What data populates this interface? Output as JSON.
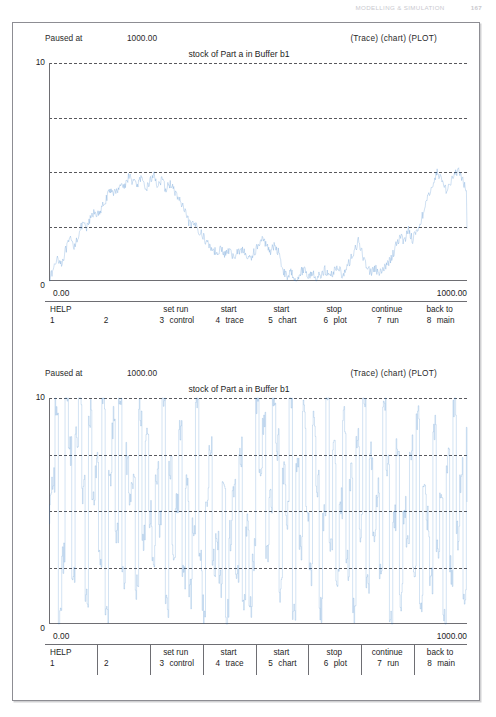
{
  "running_head": {
    "title": "MODELLING & SIMULATION",
    "page": "167"
  },
  "panels": [
    {
      "id": "chart-panel",
      "status_label": "Paused at",
      "status_value": "1000.00",
      "mode_tags": "(Trace) (chart) (PLOT)",
      "title": "stock of Part a in Buffer b1",
      "x_min_label": "0.00",
      "x_max_label": "1000.00",
      "y_max_label": "10",
      "y_min_label": "0",
      "fkeys": [
        {
          "num": "1",
          "top": "HELP",
          "bot": ""
        },
        {
          "num": "2",
          "top": "",
          "bot": ""
        },
        {
          "num": "3",
          "top": "set run",
          "bot": "control"
        },
        {
          "num": "4",
          "top": "start",
          "bot": "trace"
        },
        {
          "num": "5",
          "top": "start",
          "bot": "chart"
        },
        {
          "num": "6",
          "top": "stop",
          "bot": "plot"
        },
        {
          "num": "7",
          "top": "continue",
          "bot": "run"
        },
        {
          "num": "8",
          "top": "back to",
          "bot": "main"
        }
      ]
    },
    {
      "id": "trace-panel",
      "status_label": "Paused at",
      "status_value": "1000.00",
      "mode_tags": "(Trace) (chart) (PLOT)",
      "title": "stock of Part a in Buffer b1",
      "x_min_label": "0.00",
      "x_max_label": "1000.00",
      "y_max_label": "10",
      "y_min_label": "0",
      "fkeys": [
        {
          "num": "1",
          "top": "HELP",
          "bot": ""
        },
        {
          "num": "2",
          "top": "",
          "bot": ""
        },
        {
          "num": "3",
          "top": "set run",
          "bot": "control"
        },
        {
          "num": "4",
          "top": "start",
          "bot": "trace"
        },
        {
          "num": "5",
          "top": "start",
          "bot": "chart"
        },
        {
          "num": "6",
          "top": "stop",
          "bot": "plot"
        },
        {
          "num": "7",
          "top": "continue",
          "bot": "run"
        },
        {
          "num": "8",
          "top": "back to",
          "bot": "main"
        }
      ]
    }
  ],
  "colors": {
    "trace": "#1f6fc4",
    "grid": "#58585c",
    "axis": "#6e6e73",
    "frame": "#8d8d93"
  },
  "chart_data": [
    {
      "type": "line",
      "title": "stock of Part a in Buffer b1",
      "xlabel": "",
      "ylabel": "",
      "xlim": [
        0,
        1000
      ],
      "ylim": [
        0,
        10
      ],
      "grid": true,
      "gridlines_y": [
        2.5,
        5.0,
        7.5,
        10.0
      ],
      "legend": "none",
      "series_name": "stock of Part a in Buffer b1",
      "x": [
        0,
        10,
        20,
        30,
        40,
        50,
        60,
        70,
        80,
        90,
        100,
        110,
        120,
        130,
        140,
        150,
        160,
        170,
        180,
        190,
        200,
        210,
        220,
        230,
        240,
        250,
        260,
        270,
        280,
        290,
        300,
        310,
        320,
        330,
        340,
        350,
        360,
        370,
        380,
        390,
        400,
        410,
        420,
        430,
        440,
        450,
        460,
        470,
        480,
        490,
        500,
        510,
        520,
        530,
        540,
        550,
        560,
        570,
        580,
        590,
        600,
        610,
        620,
        630,
        640,
        650,
        660,
        670,
        680,
        690,
        700,
        710,
        720,
        730,
        740,
        750,
        760,
        770,
        780,
        790,
        800,
        810,
        820,
        830,
        840,
        850,
        860,
        870,
        880,
        890,
        900,
        910,
        920,
        930,
        940,
        950,
        960,
        970,
        980,
        990,
        1000
      ],
      "y": [
        0.0,
        0.5,
        1.1,
        0.8,
        1.4,
        1.9,
        1.6,
        2.1,
        2.6,
        2.4,
        2.9,
        3.2,
        3.0,
        3.5,
        3.9,
        4.2,
        4.0,
        4.5,
        4.3,
        4.8,
        4.6,
        4.4,
        4.7,
        4.2,
        4.5,
        4.9,
        4.4,
        4.6,
        4.2,
        4.5,
        4.1,
        3.8,
        3.4,
        2.9,
        2.5,
        2.6,
        2.3,
        2.0,
        1.7,
        1.5,
        1.3,
        1.5,
        1.2,
        1.4,
        1.1,
        1.3,
        1.5,
        1.2,
        1.0,
        1.3,
        1.6,
        1.9,
        1.7,
        1.4,
        1.6,
        1.3,
        0.5,
        0.2,
        0.4,
        0.1,
        0.3,
        0.6,
        0.2,
        0.4,
        0.1,
        0.3,
        0.5,
        0.2,
        0.4,
        0.7,
        0.3,
        0.5,
        0.9,
        1.4,
        1.8,
        1.2,
        0.7,
        0.4,
        0.6,
        0.3,
        0.5,
        0.8,
        1.1,
        1.6,
        2.1,
        1.8,
        2.4,
        1.9,
        2.3,
        2.8,
        3.4,
        4.0,
        4.6,
        5.0,
        4.6,
        4.2,
        4.5,
        4.9,
        5.0,
        4.6,
        4.1,
        3.8,
        3.4,
        2.8,
        2.4
      ]
    },
    {
      "type": "line",
      "title": "stock of Part a in Buffer b1",
      "xlabel": "",
      "ylabel": "",
      "xlim": [
        0,
        1000
      ],
      "ylim": [
        0,
        10
      ],
      "grid": true,
      "gridlines_y": [
        2.5,
        5.0,
        7.5,
        10.0
      ],
      "legend": "none",
      "series_name": "stock of Part a in Buffer b1 (trace / step)",
      "note": "high-frequency step trace oscillating across the full 0-10 range",
      "x": [
        0,
        8,
        16,
        24,
        32,
        40,
        48,
        56,
        64,
        72,
        80,
        88,
        96,
        104,
        112,
        120,
        128,
        136,
        144,
        152,
        160,
        168,
        176,
        184,
        192,
        200,
        208,
        216,
        224,
        232,
        240,
        248,
        256,
        264,
        272,
        280,
        288,
        296,
        304,
        312,
        320,
        328,
        336,
        344,
        352,
        360,
        368,
        376,
        384,
        392,
        400,
        408,
        416,
        424,
        432,
        440,
        448,
        456,
        464,
        472,
        480,
        488,
        496,
        504,
        512,
        520,
        528,
        536,
        544,
        552,
        560,
        568,
        576,
        584,
        592,
        600,
        608,
        616,
        624,
        632,
        640,
        648,
        656,
        664,
        672,
        680,
        688,
        696,
        704,
        712,
        720,
        728,
        736,
        744,
        752,
        760,
        768,
        776,
        784,
        792,
        800,
        808,
        816,
        824,
        832,
        840,
        848,
        856,
        864,
        872,
        880,
        888,
        896,
        904,
        912,
        920,
        928,
        936,
        944,
        952,
        960,
        968,
        976,
        984,
        992,
        1000
      ],
      "y": [
        5.0,
        6.5,
        10.0,
        0.0,
        3.0,
        10.0,
        7.8,
        2.0,
        8.4,
        10.0,
        6.0,
        1.0,
        9.2,
        5.5,
        7.0,
        3.2,
        10.0,
        0.4,
        6.8,
        8.9,
        4.1,
        10.0,
        2.3,
        7.4,
        5.8,
        6.2,
        1.5,
        9.5,
        3.7,
        8.1,
        5.0,
        2.8,
        6.6,
        4.4,
        10.0,
        0.9,
        7.2,
        3.5,
        5.1,
        8.6,
        2.1,
        6.0,
        1.2,
        4.7,
        9.8,
        3.0,
        0.6,
        5.4,
        7.9,
        2.6,
        4.0,
        1.8,
        6.3,
        0.3,
        3.8,
        5.9,
        2.2,
        7.5,
        1.0,
        4.3,
        0.8,
        3.1,
        10.0,
        6.7,
        9.1,
        2.9,
        5.6,
        10.0,
        8.0,
        1.4,
        6.9,
        4.8,
        10.0,
        0.2,
        7.1,
        3.3,
        9.4,
        5.2,
        2.4,
        8.8,
        6.1,
        0.7,
        4.9,
        10.0,
        3.6,
        7.7,
        1.9,
        5.3,
        9.0,
        2.7,
        6.4,
        0.5,
        8.3,
        4.2,
        10.0,
        1.6,
        7.3,
        3.9,
        5.7,
        2.0,
        9.6,
        6.8,
        0.1,
        4.5,
        8.2,
        1.3,
        5.0,
        3.4,
        7.6,
        2.5,
        9.3,
        0.9,
        6.1,
        4.6,
        1.7,
        8.5,
        3.2,
        5.8,
        0.4,
        7.0,
        2.3,
        9.9,
        4.0,
        6.6,
        1.1,
        8.7,
        3.7,
        5.4
      ]
    }
  ]
}
